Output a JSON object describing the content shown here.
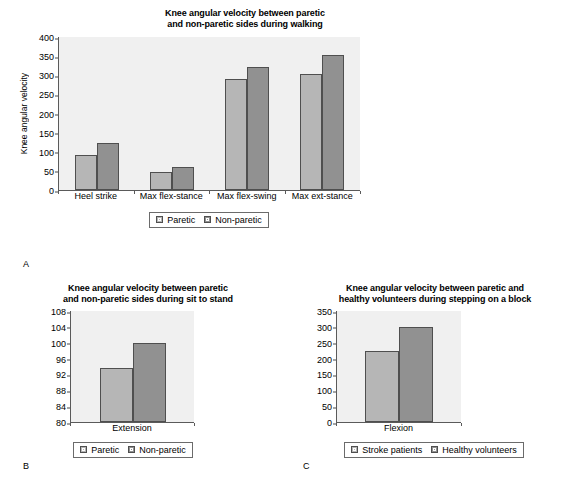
{
  "figure": {
    "panel_letters": {
      "a": "A",
      "b": "B",
      "c": "C"
    }
  },
  "chart_data": [
    {
      "id": "A",
      "type": "bar",
      "title": "Knee angular velocity between paretic and non-paretic sides during walking",
      "title_lines": [
        "Knee angular velocity between paretic",
        "and non-paretic sides during walking"
      ],
      "xlabel": "",
      "ylabel": "Knee angular velocity",
      "ylim": [
        0,
        400
      ],
      "yticks": [
        0,
        50,
        100,
        150,
        200,
        250,
        300,
        350,
        400
      ],
      "grid": false,
      "legend_position": "bottom",
      "categories": [
        "Heel strike",
        "Max flex-stance",
        "Max flex-swing",
        "Max ext-stance"
      ],
      "series": [
        {
          "name": "Paretic",
          "color": "#b6b6b6",
          "values": [
            92,
            47,
            291,
            303
          ]
        },
        {
          "name": "Non-paretic",
          "color": "#919191",
          "values": [
            124,
            61,
            321,
            352
          ]
        }
      ]
    },
    {
      "id": "B",
      "type": "bar",
      "title": "Knee angular velocity between paretic and non-paretic sides during sit to stand",
      "title_lines": [
        "Knee angular velocity between paretic",
        "and non-paretic sides during sit to stand"
      ],
      "xlabel": "",
      "ylabel": "",
      "ylim": [
        80,
        108
      ],
      "yticks": [
        80,
        84,
        88,
        92,
        96,
        100,
        104,
        108
      ],
      "grid": false,
      "legend_position": "bottom",
      "categories": [
        "Extension"
      ],
      "series": [
        {
          "name": "Paretic",
          "color": "#b6b6b6",
          "values": [
            93.5
          ]
        },
        {
          "name": "Non-paretic",
          "color": "#919191",
          "values": [
            100
          ]
        }
      ]
    },
    {
      "id": "C",
      "type": "bar",
      "title": "Knee angular velocity between paretic and healthy volunteers during stepping on a block",
      "title_lines": [
        "Knee angular velocity between paretic and",
        "healthy volunteers during stepping on a block"
      ],
      "xlabel": "",
      "ylabel": "",
      "ylim": [
        0,
        350
      ],
      "yticks": [
        0,
        50,
        100,
        150,
        200,
        250,
        300,
        350
      ],
      "grid": false,
      "legend_position": "bottom",
      "categories": [
        "Flexion"
      ],
      "series": [
        {
          "name": "Stroke patients",
          "color": "#b6b6b6",
          "values": [
            225
          ]
        },
        {
          "name": "Healthy volunteers",
          "color": "#919191",
          "values": [
            300
          ]
        }
      ]
    }
  ]
}
